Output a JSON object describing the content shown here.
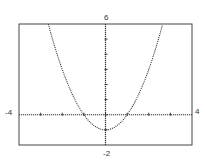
{
  "chart_data": {
    "type": "line",
    "title": "",
    "xlabel": "",
    "ylabel": "",
    "xlim": [
      -4,
      4
    ],
    "ylim": [
      -2,
      6
    ],
    "x_tick_step": 1,
    "y_tick_step": 1,
    "grid": false,
    "series": [
      {
        "name": "y = x^2 - 1",
        "style": "dotted",
        "x": [
          -2.65,
          -2,
          -1.5,
          -1,
          -0.5,
          0,
          0.5,
          1,
          1.5,
          2,
          2.65
        ],
        "y": [
          6.0,
          3,
          1.25,
          0,
          -0.75,
          -1,
          -0.75,
          0,
          1.25,
          3,
          6.0
        ]
      }
    ],
    "tick_labels": {
      "x_min": "-4",
      "x_max": "4",
      "y_max": "6",
      "y_min": "-2"
    }
  },
  "labels": {
    "x_min": "-4",
    "x_max": "4",
    "y_max": "6",
    "y_min": "-2"
  }
}
